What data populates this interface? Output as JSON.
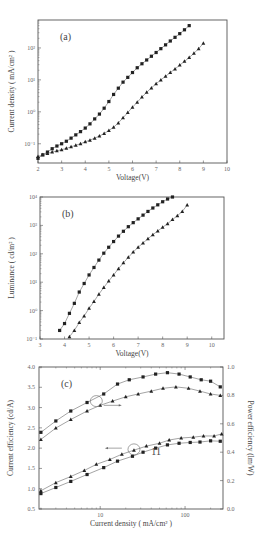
{
  "chart_data": [
    {
      "type": "scatter",
      "panel_label": "(a)",
      "xlabel": "Voltage(V)",
      "ylabel": "Current density ( mA/cm² )",
      "yscale": "log",
      "xlim": [
        2,
        10
      ],
      "ylim": [
        0.025,
        750
      ],
      "xticks": [
        2,
        3,
        4,
        5,
        6,
        7,
        8,
        9,
        10
      ],
      "yticks": [
        {
          "value": 0.1,
          "label": "10⁻¹"
        },
        {
          "value": 1,
          "label": "10⁰"
        },
        {
          "value": 10,
          "label": "10¹"
        },
        {
          "value": 100,
          "label": "10²"
        }
      ],
      "series": [
        {
          "name": "device-square",
          "marker": "square",
          "x": [
            2.0,
            2.2,
            2.4,
            2.6,
            2.8,
            3.0,
            3.2,
            3.4,
            3.6,
            3.8,
            4.0,
            4.2,
            4.4,
            4.6,
            4.8,
            5.0,
            5.2,
            5.4,
            5.6,
            5.8,
            6.0,
            6.2,
            6.4,
            6.6,
            6.8,
            7.0,
            7.2,
            7.4,
            7.6,
            7.8,
            8.0,
            8.2,
            8.4
          ],
          "y": [
            0.035,
            0.045,
            0.055,
            0.07,
            0.085,
            0.1,
            0.12,
            0.15,
            0.19,
            0.24,
            0.31,
            0.42,
            0.6,
            0.85,
            1.3,
            2.1,
            3.5,
            5.5,
            8.5,
            12,
            17,
            24,
            32,
            42,
            55,
            72,
            95,
            125,
            165,
            215,
            280,
            370,
            500
          ]
        },
        {
          "name": "device-triangle",
          "marker": "triangle",
          "x": [
            2.0,
            2.2,
            2.4,
            2.6,
            2.8,
            3.0,
            3.2,
            3.4,
            3.6,
            3.8,
            4.0,
            4.2,
            4.4,
            4.6,
            4.8,
            5.0,
            5.2,
            5.4,
            5.6,
            5.8,
            6.0,
            6.2,
            6.4,
            6.6,
            6.8,
            7.0,
            7.2,
            7.4,
            7.6,
            7.8,
            8.0,
            8.2,
            8.4,
            8.6,
            8.8,
            9.0
          ],
          "y": [
            0.04,
            0.045,
            0.05,
            0.055,
            0.06,
            0.065,
            0.072,
            0.08,
            0.09,
            0.1,
            0.115,
            0.13,
            0.15,
            0.175,
            0.21,
            0.26,
            0.33,
            0.45,
            0.65,
            0.95,
            1.4,
            2.0,
            2.9,
            4.1,
            5.6,
            7.6,
            10,
            13,
            17,
            22,
            29,
            38,
            50,
            68,
            95,
            140
          ]
        }
      ]
    },
    {
      "type": "scatter",
      "panel_label": "(b)",
      "xlabel": "Voltage(V)",
      "ylabel": "Luminance ( cd/m² )",
      "yscale": "log",
      "xlim": [
        3,
        10.5
      ],
      "ylim": [
        0.1,
        10000
      ],
      "xticks": [
        3,
        4,
        5,
        6,
        7,
        8,
        9,
        10
      ],
      "yticks": [
        {
          "value": 0.1,
          "label": "10⁻¹"
        },
        {
          "value": 1,
          "label": "10⁰"
        },
        {
          "value": 10,
          "label": "10¹"
        },
        {
          "value": 100,
          "label": "10²"
        },
        {
          "value": 1000,
          "label": "10³"
        },
        {
          "value": 10000,
          "label": "10⁴"
        }
      ],
      "series": [
        {
          "name": "device-square",
          "marker": "square",
          "x": [
            3.8,
            4.0,
            4.2,
            4.4,
            4.6,
            4.8,
            5.0,
            5.2,
            5.4,
            5.6,
            5.8,
            6.0,
            6.2,
            6.4,
            6.6,
            6.8,
            7.0,
            7.2,
            7.4,
            7.6,
            7.8,
            8.0,
            8.2,
            8.4
          ],
          "y": [
            0.2,
            0.35,
            0.8,
            1.8,
            4.5,
            9,
            18,
            33,
            60,
            105,
            170,
            270,
            420,
            620,
            900,
            1250,
            1700,
            2300,
            3100,
            4100,
            5300,
            6800,
            8500,
            10000
          ]
        },
        {
          "name": "device-triangle",
          "marker": "triangle",
          "x": [
            4.2,
            4.4,
            4.6,
            4.8,
            5.0,
            5.2,
            5.4,
            5.6,
            5.8,
            6.0,
            6.2,
            6.4,
            6.6,
            6.8,
            7.0,
            7.2,
            7.4,
            7.6,
            7.8,
            8.0,
            8.2,
            8.4,
            8.6,
            8.8,
            9.0
          ],
          "y": [
            0.12,
            0.2,
            0.38,
            0.65,
            1.2,
            2.1,
            3.8,
            6.5,
            11,
            18,
            30,
            48,
            75,
            115,
            170,
            240,
            340,
            470,
            640,
            860,
            1150,
            1600,
            2200,
            3100,
            5200
          ]
        }
      ]
    },
    {
      "type": "scatter",
      "panel_label": "(c)",
      "xlabel": "Current density ( mA/cm² )",
      "ylabel": "Current efficiency (cd/A)",
      "ylabel_right": "Power efficiency (lm/W)",
      "xscale": "log",
      "xlim": [
        1.9,
        280
      ],
      "ylim": [
        0.5,
        4.0
      ],
      "ylim_right": [
        0.0,
        1.0
      ],
      "xticks": [
        {
          "value": 10,
          "label": "10"
        },
        {
          "value": 100,
          "label": "100"
        }
      ],
      "yticks": [
        0.5,
        1.0,
        1.5,
        2.0,
        2.5,
        3.0,
        3.5,
        4.0
      ],
      "yticks_right": [
        0.0,
        0.2,
        0.4,
        0.6,
        0.8,
        1.0
      ],
      "annotations": [
        {
          "text": "→",
          "meaning": "upper curves read on right axis (Power efficiency)"
        },
        {
          "text": "←",
          "meaning": "lower curves read on left axis (Current efficiency)"
        },
        {
          "text": "11",
          "position": "near lower curves at ~30 mA/cm²"
        }
      ],
      "series": [
        {
          "name": "power-efficiency-square",
          "axis": "right",
          "marker": "square",
          "x": [
            2,
            3,
            4.5,
            7,
            11,
            16,
            22,
            32,
            45,
            62,
            85,
            115,
            155,
            200,
            260
          ],
          "y": [
            0.54,
            0.62,
            0.69,
            0.75,
            0.81,
            0.88,
            0.91,
            0.93,
            0.95,
            0.96,
            0.95,
            0.93,
            0.91,
            0.9,
            0.86
          ]
        },
        {
          "name": "power-efficiency-triangle",
          "axis": "right",
          "marker": "triangle",
          "x": [
            2,
            3,
            4.5,
            7,
            10,
            14,
            20,
            28,
            40,
            55,
            78,
            110,
            150,
            200,
            260
          ],
          "y": [
            0.49,
            0.57,
            0.63,
            0.69,
            0.73,
            0.76,
            0.79,
            0.81,
            0.83,
            0.85,
            0.86,
            0.85,
            0.83,
            0.81,
            0.8
          ]
        },
        {
          "name": "current-efficiency-triangle",
          "axis": "left",
          "marker": "triangle",
          "x": [
            2,
            3,
            4.5,
            6.5,
            9,
            13,
            18,
            25,
            35,
            50,
            65,
            90,
            125,
            165,
            220,
            270
          ],
          "y": [
            0.95,
            1.15,
            1.3,
            1.45,
            1.6,
            1.72,
            1.85,
            1.95,
            2.05,
            2.12,
            2.2,
            2.25,
            2.27,
            2.3,
            2.3,
            2.35
          ]
        },
        {
          "name": "current-efficiency-square",
          "axis": "left",
          "marker": "square",
          "x": [
            2,
            3,
            4.5,
            7,
            11,
            16,
            24,
            32,
            45,
            62,
            85,
            115,
            150,
            200,
            260
          ],
          "y": [
            0.88,
            1.03,
            1.18,
            1.35,
            1.52,
            1.68,
            1.8,
            1.9,
            2.0,
            2.08,
            2.12,
            2.14,
            2.15,
            2.18,
            2.17
          ]
        }
      ]
    }
  ],
  "layout": {
    "panels": [
      {
        "x0": 38,
        "y0": 20,
        "x1": 227,
        "y1": 163
      },
      {
        "x0": 40,
        "y0": 197,
        "x1": 224,
        "y1": 339
      },
      {
        "x0": 39,
        "y0": 367,
        "x1": 223,
        "y1": 509
      }
    ],
    "colors": {
      "axis": "#555555",
      "marker": "#222222",
      "line": "#666666",
      "text": "#444444"
    }
  }
}
